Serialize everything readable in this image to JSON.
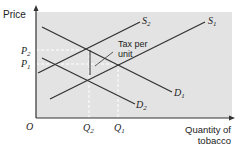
{
  "diagram": {
    "type": "supply-demand",
    "title": "",
    "y_axis_label": "Price",
    "x_axis_label_line1": "Quantity of",
    "x_axis_label_line2": "tobacco",
    "origin_label": "O",
    "price_labels": {
      "p2": "P",
      "p2_sub": "2",
      "p1": "P",
      "p1_sub": "1"
    },
    "quantity_labels": {
      "q2": "Q",
      "q2_sub": "2",
      "q1": "Q",
      "q1_sub": "1"
    },
    "curves": {
      "s1": {
        "label": "S",
        "sub": "1"
      },
      "s2": {
        "label": "S",
        "sub": "2"
      },
      "d1": {
        "label": "D",
        "sub": "1"
      },
      "d2": {
        "label": "D",
        "sub": "2"
      }
    },
    "annotation_line1": "Tax per",
    "annotation_line2": "unit",
    "colors": {
      "plot_bg": "#e3e3e3",
      "line": "#333333",
      "axis": "#333333",
      "guide": "#ffffff"
    }
  }
}
